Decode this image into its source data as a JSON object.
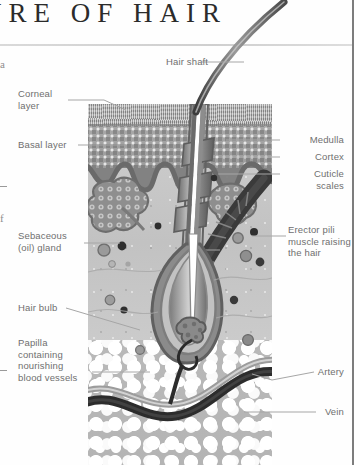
{
  "header": {
    "title": "URE OF HAIR",
    "full_title_hint": "URE OF HAIR"
  },
  "bleed_fragments": [
    {
      "text": "a",
      "top": 58
    },
    {
      "text": "f",
      "top": 212
    }
  ],
  "labels": {
    "hair_shaft": "Hair shaft",
    "corneal_layer": "Corneal\nlayer",
    "corneal_layer_line1": "Corneal",
    "corneal_layer_line2": "layer",
    "basal_layer": "Basal layer",
    "sebaceous_line1": "Sebaceous",
    "sebaceous_line2": "(oil) gland",
    "hair_bulb": "Hair bulb",
    "papilla_line1": "Papilla",
    "papilla_line2": "containing",
    "papilla_line3": "nourishing",
    "papilla_line4": "blood vessels",
    "medulla": "Medulla",
    "cortex": "Cortex",
    "cuticle_line1": "Cuticle",
    "cuticle_line2": "scales",
    "erector_line1": "Erector pili",
    "erector_line2": "muscle raising",
    "erector_line3": "the hair",
    "artery": "Artery",
    "vein": "Vein"
  },
  "colors": {
    "title_text": "#2b2b2b",
    "label_text": "#6f6f6f",
    "leader_line": "#a6a6a6",
    "corneal_layer": "#949494",
    "basal_layer": "#a3a3a3",
    "dermis": "#c6c6c6",
    "fat": "#b6b6b6",
    "hair": "#4a4a4a",
    "muscle": "#3c3c3c",
    "vein": "#2e2e2e",
    "artery": "#9c9c9c",
    "page_edge": "#7d7d7d"
  }
}
